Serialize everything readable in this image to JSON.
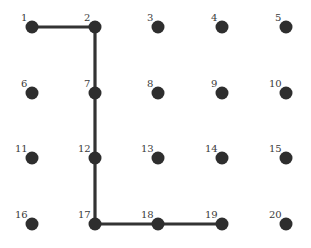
{
  "diagram": {
    "type": "grid-graph-path",
    "rows": 4,
    "cols": 5,
    "node_color": "#2e2e2e",
    "edge_color": "#333333",
    "nodes": [
      {
        "id": "1",
        "x": 32,
        "y": 27
      },
      {
        "id": "2",
        "x": 95,
        "y": 27
      },
      {
        "id": "3",
        "x": 158,
        "y": 27
      },
      {
        "id": "4",
        "x": 222,
        "y": 27
      },
      {
        "id": "5",
        "x": 286,
        "y": 27
      },
      {
        "id": "6",
        "x": 32,
        "y": 93
      },
      {
        "id": "7",
        "x": 95,
        "y": 93
      },
      {
        "id": "8",
        "x": 158,
        "y": 93
      },
      {
        "id": "9",
        "x": 222,
        "y": 93
      },
      {
        "id": "10",
        "x": 286,
        "y": 93
      },
      {
        "id": "11",
        "x": 32,
        "y": 158
      },
      {
        "id": "12",
        "x": 95,
        "y": 158
      },
      {
        "id": "13",
        "x": 158,
        "y": 158
      },
      {
        "id": "14",
        "x": 222,
        "y": 158
      },
      {
        "id": "15",
        "x": 286,
        "y": 158
      },
      {
        "id": "16",
        "x": 32,
        "y": 224
      },
      {
        "id": "17",
        "x": 95,
        "y": 224
      },
      {
        "id": "18",
        "x": 158,
        "y": 224
      },
      {
        "id": "19",
        "x": 222,
        "y": 224
      },
      {
        "id": "20",
        "x": 286,
        "y": 224
      }
    ],
    "path": [
      "1",
      "2",
      "7",
      "12",
      "17",
      "18",
      "19"
    ],
    "edges": [
      [
        "1",
        "2"
      ],
      [
        "2",
        "7"
      ],
      [
        "7",
        "12"
      ],
      [
        "12",
        "17"
      ],
      [
        "17",
        "18"
      ],
      [
        "18",
        "19"
      ]
    ]
  }
}
